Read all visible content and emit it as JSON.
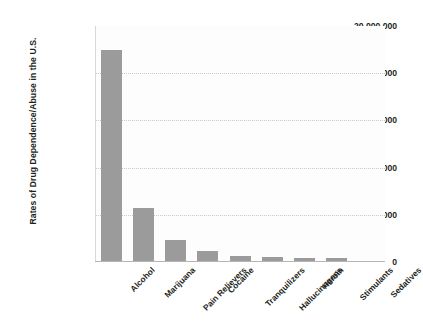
{
  "chart_data": {
    "type": "bar",
    "title": "",
    "xlabel": "",
    "ylabel": "Rates of Drug Dependence/Abuse in the U.S.",
    "categories": [
      "Alcohol",
      "Marijuana",
      "Pain Relievers",
      "Cocaine",
      "Tranquilizers",
      "Hallucinogens",
      "Heroin",
      "Stimulants",
      "Sedatives"
    ],
    "values": [
      18000000,
      4600000,
      1900000,
      900000,
      550000,
      400000,
      370000,
      340000,
      100000
    ],
    "ylim": [
      0,
      20000000
    ],
    "ytick_values": [
      0,
      4000000,
      8000000,
      12000000,
      16000000,
      20000000
    ],
    "ytick_labels": [
      "0",
      "4,000,000",
      "8,000,000",
      "12,000,000",
      "16,000,000",
      "20,000,000"
    ],
    "grid": true,
    "grid_axis": "y",
    "legend": false,
    "bar_color": "#9b9b9b",
    "gridline_color": "#c9c9c9",
    "text_color": "#231f20",
    "background_color": "#ffffff"
  }
}
